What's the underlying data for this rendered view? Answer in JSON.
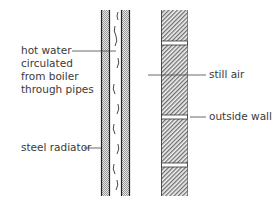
{
  "diagram": {
    "labels": {
      "hot_water": [
        "hot water",
        "circulated",
        "from boiler",
        "through pipes"
      ],
      "steel_radiator": "steel radiator",
      "still_air": "still air",
      "outside_wall": "outside wall"
    },
    "colors": {
      "line": "#333333",
      "radiator_fill": "#c8c8c8",
      "wall_hatch": "#7a7a7a",
      "background": "#ffffff"
    }
  }
}
